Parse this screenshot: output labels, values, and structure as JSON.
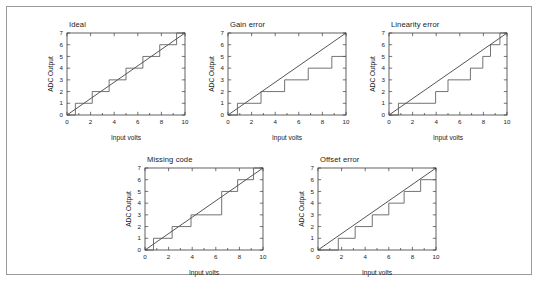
{
  "figure": {
    "background_color": "#ffffff",
    "border_color": "#9a9a9a",
    "line_color": "#2a2a2a",
    "stair_color": "#5a5a5a"
  },
  "common": {
    "xlabel": "Input volts",
    "ylabel": "ADC Output",
    "xlim": [
      0,
      10
    ],
    "ylim": [
      0,
      7
    ],
    "xticks": [
      0,
      2,
      4,
      6,
      8,
      10
    ],
    "yticks": [
      0,
      1,
      2,
      3,
      4,
      5,
      6,
      7
    ],
    "xtick_labels": [
      "0",
      "2",
      "4",
      "6",
      "8",
      "10"
    ],
    "ytick_labels": [
      "0",
      "1",
      "2",
      "3",
      "4",
      "5",
      "6",
      "7"
    ],
    "grid": false,
    "legend": null
  },
  "chart_data": [
    {
      "type": "line",
      "id": "ideal",
      "title": "Ideal",
      "xlabel": "Input volts",
      "ylabel": "ADC Output",
      "xlim": [
        0,
        10
      ],
      "ylim": [
        0,
        7
      ],
      "xticks": [
        0,
        2,
        4,
        6,
        8,
        10
      ],
      "yticks": [
        0,
        1,
        2,
        3,
        4,
        5,
        6,
        7
      ],
      "grid": false,
      "series": [
        {
          "name": "Ideal transfer line",
          "kind": "straight",
          "x": [
            0,
            10
          ],
          "values": [
            0,
            7
          ]
        },
        {
          "name": "ADC staircase",
          "kind": "staircase",
          "transitions": [
            0.71,
            2.14,
            3.57,
            5.0,
            6.43,
            7.86,
            9.29
          ],
          "codes": [
            0,
            1,
            2,
            3,
            4,
            5,
            6,
            7
          ]
        }
      ]
    },
    {
      "type": "line",
      "id": "gain_error",
      "title": "Gain error",
      "xlabel": "Input volts",
      "ylabel": "ADC Output",
      "xlim": [
        0,
        10
      ],
      "ylim": [
        0,
        7
      ],
      "xticks": [
        0,
        2,
        4,
        6,
        8,
        10
      ],
      "yticks": [
        0,
        1,
        2,
        3,
        4,
        5,
        6,
        7
      ],
      "grid": false,
      "series": [
        {
          "name": "Ideal transfer line",
          "kind": "straight",
          "x": [
            0,
            10
          ],
          "values": [
            0,
            7
          ]
        },
        {
          "name": "ADC staircase",
          "kind": "staircase",
          "transitions": [
            0.8,
            2.8,
            4.8,
            6.8,
            8.8
          ],
          "codes": [
            0,
            1,
            2,
            3,
            4,
            5
          ]
        }
      ]
    },
    {
      "type": "line",
      "id": "linearity_error",
      "title": "Linearity error",
      "xlabel": "Input volts",
      "ylabel": "ADC Output",
      "xlim": [
        0,
        10
      ],
      "ylim": [
        0,
        7
      ],
      "xticks": [
        0,
        2,
        4,
        6,
        8,
        10
      ],
      "yticks": [
        0,
        1,
        2,
        3,
        4,
        5,
        6,
        7
      ],
      "grid": false,
      "series": [
        {
          "name": "Ideal transfer line",
          "kind": "straight",
          "x": [
            0,
            10
          ],
          "values": [
            0,
            7
          ]
        },
        {
          "name": "ADC staircase",
          "kind": "staircase",
          "transitions": [
            0.8,
            3.95,
            5.0,
            6.9,
            7.95,
            8.6,
            9.4
          ],
          "codes": [
            0,
            1,
            2,
            3,
            4,
            5,
            6,
            7
          ]
        }
      ]
    },
    {
      "type": "line",
      "id": "missing_code",
      "title": "Missing code",
      "xlabel": "Input volts",
      "ylabel": "ADC Output",
      "xlim": [
        0,
        10
      ],
      "ylim": [
        0,
        7
      ],
      "xticks": [
        0,
        2,
        4,
        6,
        8,
        10
      ],
      "yticks": [
        0,
        1,
        2,
        3,
        4,
        5,
        6,
        7
      ],
      "grid": false,
      "series": [
        {
          "name": "Ideal transfer line",
          "kind": "straight",
          "x": [
            0,
            10
          ],
          "values": [
            0,
            7
          ]
        },
        {
          "name": "ADC staircase",
          "kind": "staircase",
          "transitions": [
            0.72,
            2.3,
            3.9,
            6.5,
            7.85,
            9.2
          ],
          "codes": [
            0,
            1,
            2,
            3,
            5,
            6,
            7
          ]
        }
      ]
    },
    {
      "type": "line",
      "id": "offset_error",
      "title": "Offset error",
      "xlabel": "Input volts",
      "ylabel": "ADC Output",
      "xlim": [
        0,
        10
      ],
      "ylim": [
        0,
        7
      ],
      "xticks": [
        0,
        2,
        4,
        6,
        8,
        10
      ],
      "yticks": [
        0,
        1,
        2,
        3,
        4,
        5,
        6,
        7
      ],
      "grid": false,
      "series": [
        {
          "name": "Ideal transfer line",
          "kind": "straight",
          "x": [
            0,
            10
          ],
          "values": [
            0,
            7
          ]
        },
        {
          "name": "ADC staircase",
          "kind": "staircase",
          "transitions": [
            1.72,
            3.15,
            4.6,
            6.0,
            7.3,
            8.7
          ],
          "codes": [
            0,
            1,
            2,
            3,
            4,
            5,
            6
          ]
        }
      ]
    }
  ],
  "panels": [
    {
      "id": "ideal",
      "left": 34,
      "top": 13,
      "width": 150,
      "height": 125
    },
    {
      "id": "gain_error",
      "left": 195,
      "top": 13,
      "width": 150,
      "height": 125
    },
    {
      "id": "linearity_error",
      "left": 356,
      "top": 13,
      "width": 150,
      "height": 125
    },
    {
      "id": "missing_code",
      "left": 112,
      "top": 148,
      "width": 150,
      "height": 125
    },
    {
      "id": "offset_error",
      "left": 285,
      "top": 148,
      "width": 150,
      "height": 125
    }
  ]
}
